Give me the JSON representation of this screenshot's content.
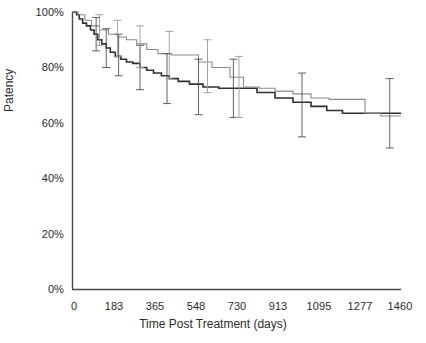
{
  "chart_data": {
    "type": "line",
    "title": "",
    "xlabel": "Time Post Treatment (days)",
    "ylabel": "Patency",
    "xlim": [
      0,
      1460
    ],
    "ylim": [
      0,
      100
    ],
    "grid": false,
    "legend": "none",
    "xticks": [
      0,
      183,
      365,
      548,
      730,
      913,
      1095,
      1277,
      1460
    ],
    "xtick_labels": [
      "0",
      "183",
      "365",
      "548",
      "730",
      "913",
      "1095",
      "1277",
      "1460"
    ],
    "yticks": [
      0,
      20,
      40,
      60,
      80,
      100
    ],
    "ytick_labels": [
      "0%",
      "20%",
      "40%",
      "60%",
      "80%",
      "100%"
    ],
    "series": [
      {
        "name": "group-a-dark",
        "style": "step",
        "color": "#303030",
        "x": [
          0,
          18,
          30,
          45,
          62,
          80,
          96,
          112,
          130,
          150,
          168,
          190,
          215,
          240,
          268,
          300,
          330,
          360,
          395,
          430,
          470,
          520,
          580,
          650,
          700,
          730,
          820,
          900,
          980,
          1060,
          1130,
          1200,
          1460
        ],
        "y": [
          100,
          99,
          97.5,
          96,
          95,
          93.5,
          92,
          90,
          88.5,
          87,
          85.5,
          84,
          83,
          82,
          81.5,
          80,
          79,
          78,
          77,
          76,
          75,
          74,
          73,
          72.5,
          72.5,
          72.5,
          71,
          69,
          67.5,
          66,
          64.5,
          63.5,
          63.5
        ]
      },
      {
        "name": "group-b-light",
        "style": "step",
        "color": "#8a8a8a",
        "x": [
          0,
          25,
          55,
          85,
          120,
          160,
          200,
          240,
          285,
          330,
          380,
          440,
          500,
          560,
          620,
          700,
          760,
          830,
          900,
          980,
          1060,
          1140,
          1230,
          1300,
          1370,
          1460
        ],
        "y": [
          100,
          99,
          97,
          95,
          93.5,
          92,
          91,
          90,
          88.5,
          86.5,
          85,
          84.5,
          84.5,
          82,
          80,
          76.5,
          73,
          72.5,
          71.5,
          70.5,
          69,
          68.5,
          68.5,
          63.5,
          62.5,
          62.5
        ]
      }
    ],
    "error_bars": [
      {
        "x": 105,
        "y": 92,
        "lo": 86,
        "hi": 98,
        "series": "group-a-dark"
      },
      {
        "x": 150,
        "y": 87,
        "lo": 80,
        "hi": 94,
        "series": "group-a-dark"
      },
      {
        "x": 205,
        "y": 84,
        "lo": 77,
        "hi": 92,
        "series": "group-a-dark"
      },
      {
        "x": 300,
        "y": 80,
        "lo": 72,
        "hi": 88,
        "series": "group-a-dark"
      },
      {
        "x": 420,
        "y": 76,
        "lo": 67,
        "hi": 85,
        "series": "group-a-dark"
      },
      {
        "x": 560,
        "y": 73,
        "lo": 63,
        "hi": 83,
        "series": "group-a-dark"
      },
      {
        "x": 715,
        "y": 72.5,
        "lo": 62,
        "hi": 83,
        "series": "group-a-dark"
      },
      {
        "x": 1020,
        "y": 66.5,
        "lo": 55,
        "hi": 78,
        "series": "group-a-dark"
      },
      {
        "x": 1410,
        "y": 63.5,
        "lo": 51,
        "hi": 76,
        "series": "group-a-dark"
      },
      {
        "x": 120,
        "y": 93.5,
        "lo": 88,
        "hi": 99,
        "series": "group-b-light"
      },
      {
        "x": 200,
        "y": 91,
        "lo": 84,
        "hi": 97,
        "series": "group-b-light"
      },
      {
        "x": 300,
        "y": 88,
        "lo": 80,
        "hi": 95,
        "series": "group-b-light"
      },
      {
        "x": 430,
        "y": 85,
        "lo": 76,
        "hi": 93,
        "series": "group-b-light"
      },
      {
        "x": 600,
        "y": 81,
        "lo": 71,
        "hi": 90,
        "series": "group-b-light"
      },
      {
        "x": 740,
        "y": 73,
        "lo": 62,
        "hi": 84,
        "series": "group-b-light"
      }
    ]
  },
  "axes": {
    "ylabel": "Patency",
    "xlabel": "Time Post Treatment (days)"
  }
}
